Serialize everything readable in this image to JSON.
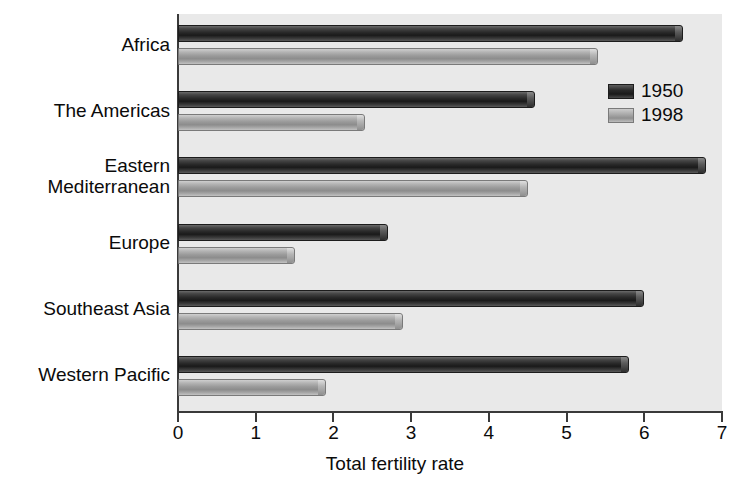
{
  "chart_data": {
    "type": "bar",
    "orientation": "horizontal",
    "title": "",
    "xlabel": "Total fertility rate",
    "ylabel": "",
    "xlim": [
      0,
      7
    ],
    "xticks": [
      "0",
      "1",
      "2",
      "3",
      "4",
      "5",
      "6",
      "7"
    ],
    "grid": false,
    "legend_position": "top-right",
    "categories": [
      "Africa",
      "The Americas",
      "Eastern\nMediterranean",
      "Europe",
      "Southeast Asia",
      "Western Pacific"
    ],
    "series": [
      {
        "name": "1950",
        "color": "#262626",
        "values": [
          6.5,
          4.6,
          6.8,
          2.7,
          6.0,
          5.8
        ]
      },
      {
        "name": "1998",
        "color": "#a6a6a6",
        "values": [
          5.4,
          2.4,
          4.5,
          1.5,
          2.9,
          1.9
        ]
      }
    ]
  },
  "legend": {
    "items": [
      {
        "label": "1950"
      },
      {
        "label": "1998"
      }
    ]
  },
  "axis": {
    "x_title": "Total fertility rate"
  },
  "colors": {
    "plot_background": "#e9e9e9",
    "page_background": "#ffffff",
    "axis": "#3a3a3a",
    "series_1950": "#262626",
    "series_1998": "#a6a6a6"
  }
}
